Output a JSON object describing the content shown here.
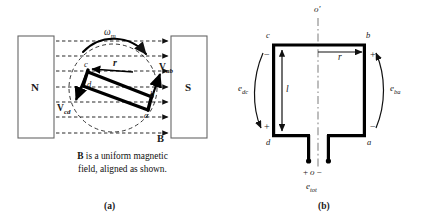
{
  "figure": {
    "caption_lines": [
      "B is a uniform magnetic",
      "field, aligned as shown."
    ],
    "caption_bold_token": "B",
    "caption_line1_rest": " is a uniform magnetic",
    "caption_line2": "field, aligned as shown.",
    "panel_a_tag": "(a)",
    "panel_b_tag": "(b)"
  },
  "panel_a": {
    "name": "rotating-coil-in-magnetic-field",
    "north_pole_label": "N",
    "south_pole_label": "S",
    "field_label": "B",
    "angular_velocity_label": "ω",
    "angular_velocity_sub": "m",
    "radius_label": "r",
    "conductor_nodes": [
      "a",
      "b",
      "c",
      "d"
    ],
    "velocity_vectors": [
      {
        "label": "V",
        "sub": "ab"
      },
      {
        "label": "V",
        "sub": "cd"
      }
    ],
    "field_line_count": 7,
    "colors": {
      "line": "#000000",
      "dashed": "#1a1a1a",
      "pole_fill": "#ffffff",
      "pole_stroke": "#555555"
    }
  },
  "panel_b": {
    "name": "coil-emf-schematic",
    "axis_label": "o′",
    "corner_labels": {
      "top_left": "c",
      "top_right": "b",
      "bottom_left": "d",
      "bottom_right": "a"
    },
    "radius_label": "r",
    "length_label": "l",
    "emf_left": {
      "label": "e",
      "sub": "dc"
    },
    "emf_right": {
      "label": "e",
      "sub": "ba"
    },
    "emf_total": {
      "label": "e",
      "sub": "tot"
    },
    "signs": {
      "top_left": "−",
      "top_right": "+",
      "bottom_left": "+",
      "bottom_right": "−"
    },
    "terminal_text": {
      "plus": "+",
      "node": "o",
      "minus": "−"
    },
    "colors": {
      "conductor": "#000000",
      "axis": "#777777"
    }
  }
}
